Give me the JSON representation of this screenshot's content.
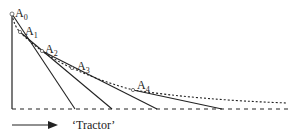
{
  "diagram": {
    "type": "tractrix-construction",
    "points": [
      {
        "label": "A",
        "sub": "0",
        "x": 12,
        "y": 14,
        "lx": 15,
        "ly": 16
      },
      {
        "label": "A",
        "sub": "1",
        "x": 20,
        "y": 32,
        "lx": 25,
        "ly": 34
      },
      {
        "label": "A",
        "sub": "2",
        "x": 42,
        "y": 51,
        "lx": 45,
        "ly": 52
      },
      {
        "label": "A",
        "sub": "3",
        "x": 72,
        "y": 68,
        "lx": 77,
        "ly": 69
      },
      {
        "label": "A",
        "sub": "4",
        "x": 133,
        "y": 90,
        "lx": 137,
        "ly": 90
      }
    ],
    "baseline_y": 109,
    "caption": "‘Tractor’",
    "colors": {
      "ink": "#222222",
      "background": "#ffffff"
    }
  }
}
